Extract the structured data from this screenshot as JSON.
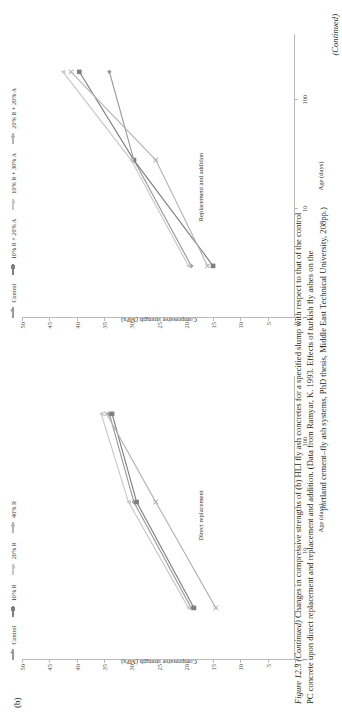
{
  "figure": {
    "panel_tag": "(b)",
    "number": "Figure 12.3",
    "continued_prefix": "(Continued)",
    "caption_line1": "Changes in compressive strengths of (b) HLI fly ash concretes for a specified slump with respect to that of the control",
    "caption_line2": "PC concrete upon direct replacement and replacement and addition. (Data from Ramyar, K. 1993. Effects of turkish fly ashes on the",
    "caption_line3": "portland cement–fly ash systems, PhD thesis, Middle East Technical University, 208pp.)",
    "continued_tail": "(Continued)"
  },
  "charts": [
    {
      "id": "direct-replacement",
      "inner_label": "Direct replacement",
      "xlabel": "Age (days)",
      "ylabel": "Compressive strength (MPa)",
      "xticks": [
        "1",
        "10",
        "100"
      ],
      "xtick_values": [
        1,
        10,
        100
      ],
      "yticks": [
        "0",
        "5",
        "10",
        "15",
        "20",
        "25",
        "30",
        "35",
        "40",
        "45",
        "50"
      ],
      "ylim": [
        0,
        50
      ],
      "xlim": [
        1,
        400
      ],
      "legend": [
        {
          "label": "Control",
          "color": "#9a9a9a",
          "marker": "diamond"
        },
        {
          "label": "10% R",
          "color": "#7f7f7f",
          "marker": "square"
        },
        {
          "label": "20% R",
          "color": "#c8c8c8",
          "marker": "triangle"
        },
        {
          "label": "40% R",
          "color": "#b5b5b5",
          "marker": "cross"
        }
      ]
    },
    {
      "id": "replacement-and-addition",
      "inner_label": "Replacement and addition",
      "xlabel": "Age (days)",
      "ylabel": "Compressive strength (MPa)",
      "xticks": [
        "1",
        "10",
        "100"
      ],
      "xtick_values": [
        1,
        10,
        100
      ],
      "yticks": [
        "0",
        "5",
        "10",
        "15",
        "20",
        "25",
        "30",
        "35",
        "40",
        "45",
        "50"
      ],
      "ylim": [
        0,
        50
      ],
      "xlim": [
        1,
        400
      ],
      "legend": [
        {
          "label": "Control",
          "color": "#9a9a9a",
          "marker": "diamond"
        },
        {
          "label": "10% R + 20% A",
          "color": "#7f7f7f",
          "marker": "square"
        },
        {
          "label": "10% R + 30% A",
          "color": "#c8c8c8",
          "marker": "triangle"
        },
        {
          "label": "20% R + 20% A",
          "color": "#b5b5b5",
          "marker": "cross"
        }
      ]
    }
  ],
  "chart_data": [
    {
      "type": "line",
      "id": "direct-replacement",
      "title": "Direct replacement",
      "xlabel": "Age (days)",
      "ylabel": "Compressive strength (MPa)",
      "xscale": "log",
      "xlim": [
        1,
        400
      ],
      "ylim": [
        0,
        50
      ],
      "xticks": [
        1,
        10,
        100
      ],
      "yticks": [
        0,
        5,
        10,
        15,
        20,
        25,
        30,
        35,
        40,
        45,
        50
      ],
      "grid": false,
      "legend_position": "top",
      "x": [
        3,
        28,
        180
      ],
      "series": [
        {
          "name": "Control",
          "color": "#9a9a9a",
          "marker": "diamond",
          "values": [
            19.0,
            29.5,
            34.0
          ]
        },
        {
          "name": "10% R",
          "color": "#7f7f7f",
          "marker": "square",
          "values": [
            18.5,
            29.0,
            33.5
          ]
        },
        {
          "name": "20% R",
          "color": "#c8c8c8",
          "marker": "triangle",
          "values": [
            19.5,
            30.5,
            35.5
          ]
        },
        {
          "name": "40% R",
          "color": "#b5b5b5",
          "marker": "cross",
          "values": [
            14.5,
            25.5,
            34.5
          ]
        }
      ]
    },
    {
      "type": "line",
      "id": "replacement-and-addition",
      "title": "Replacement and addition",
      "xlabel": "Age (days)",
      "ylabel": "Compressive strength (MPa)",
      "xscale": "log",
      "xlim": [
        1,
        400
      ],
      "ylim": [
        0,
        50
      ],
      "xticks": [
        1,
        10,
        100
      ],
      "yticks": [
        0,
        5,
        10,
        15,
        20,
        25,
        30,
        35,
        40,
        45,
        50
      ],
      "grid": false,
      "legend_position": "top",
      "x": [
        3,
        28,
        180
      ],
      "series": [
        {
          "name": "Control",
          "color": "#9a9a9a",
          "marker": "diamond",
          "values": [
            19.0,
            29.5,
            34.0
          ]
        },
        {
          "name": "10% R + 20% A",
          "color": "#7f7f7f",
          "marker": "square",
          "values": [
            15.0,
            29.5,
            39.5
          ]
        },
        {
          "name": "10% R + 30% A",
          "color": "#c8c8c8",
          "marker": "triangle",
          "values": [
            19.5,
            30.0,
            42.5
          ]
        },
        {
          "name": "20% R + 20% A",
          "color": "#b5b5b5",
          "marker": "cross",
          "values": [
            16.0,
            25.5,
            41.0
          ]
        }
      ]
    }
  ]
}
